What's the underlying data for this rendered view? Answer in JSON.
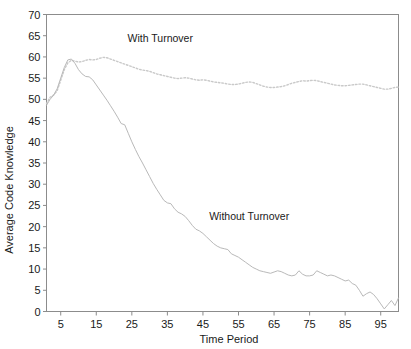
{
  "chart_data": {
    "type": "line",
    "title": "",
    "xlabel": "Time Period",
    "ylabel": "Average Code Knowledge",
    "xlim": [
      1,
      100
    ],
    "ylim": [
      0,
      70
    ],
    "grid": false,
    "legend_position": "inline-annotations",
    "xticks": [
      5,
      15,
      25,
      35,
      45,
      55,
      65,
      75,
      85,
      95
    ],
    "yticks": [
      0,
      5,
      10,
      15,
      20,
      25,
      30,
      35,
      40,
      45,
      50,
      55,
      60,
      65,
      70
    ],
    "annotations": [
      {
        "text": "With Turnover",
        "x": 33,
        "y": 63.5
      },
      {
        "text": "Without Turnover",
        "x": 58,
        "y": 21.5
      }
    ],
    "x": [
      1,
      2,
      3,
      4,
      5,
      6,
      7,
      8,
      9,
      10,
      11,
      12,
      13,
      14,
      15,
      16,
      17,
      18,
      19,
      20,
      21,
      22,
      23,
      24,
      25,
      26,
      27,
      28,
      29,
      30,
      31,
      32,
      33,
      34,
      35,
      36,
      37,
      38,
      39,
      40,
      41,
      42,
      43,
      44,
      45,
      46,
      47,
      48,
      49,
      50,
      51,
      52,
      53,
      54,
      55,
      56,
      57,
      58,
      59,
      60,
      61,
      62,
      63,
      64,
      65,
      66,
      67,
      68,
      69,
      70,
      71,
      72,
      73,
      74,
      75,
      76,
      77,
      78,
      79,
      80,
      81,
      82,
      83,
      84,
      85,
      86,
      87,
      88,
      89,
      90,
      91,
      92,
      93,
      94,
      95,
      96,
      97,
      98,
      99,
      100
    ],
    "series": [
      {
        "name": "With Turnover",
        "style": "dotted",
        "color": "#c9c9c9",
        "values": [
          49.0,
          50.5,
          51.0,
          52.0,
          54.5,
          57.0,
          58.6,
          59.2,
          59.0,
          58.8,
          58.9,
          59.2,
          59.4,
          59.3,
          59.4,
          59.7,
          59.9,
          59.8,
          59.5,
          59.2,
          58.9,
          58.6,
          58.3,
          58.0,
          57.7,
          57.4,
          57.1,
          56.9,
          56.8,
          56.6,
          56.3,
          56.0,
          55.8,
          55.6,
          55.4,
          55.2,
          55.0,
          54.9,
          55.0,
          55.1,
          55.0,
          54.8,
          54.6,
          54.5,
          54.6,
          54.5,
          54.3,
          54.1,
          54.0,
          53.9,
          53.8,
          53.6,
          53.5,
          53.5,
          53.6,
          53.8,
          54.0,
          54.1,
          54.0,
          53.7,
          53.4,
          53.1,
          52.9,
          52.8,
          52.8,
          52.9,
          53.0,
          53.2,
          53.5,
          53.8,
          54.0,
          54.2,
          54.4,
          54.3,
          54.4,
          54.5,
          54.4,
          54.2,
          54.0,
          53.8,
          53.6,
          53.4,
          53.3,
          53.2,
          53.2,
          53.3,
          53.4,
          53.5,
          53.6,
          53.6,
          53.4,
          53.2,
          53.0,
          52.8,
          52.6,
          52.4,
          52.4,
          52.6,
          52.8,
          52.9
        ]
      },
      {
        "name": "Without Turnover",
        "style": "solid",
        "color": "#b9b9b9",
        "values": [
          48.6,
          50.0,
          51.0,
          52.5,
          55.0,
          57.5,
          59.3,
          59.5,
          58.5,
          57.0,
          56.0,
          55.4,
          55.3,
          54.6,
          53.4,
          52.2,
          51.0,
          49.8,
          48.5,
          47.2,
          45.8,
          44.3,
          44.0,
          42.0,
          40.0,
          38.2,
          36.5,
          35.0,
          33.4,
          31.8,
          30.2,
          28.8,
          27.5,
          26.2,
          25.6,
          25.4,
          24.2,
          23.4,
          23.0,
          22.4,
          21.4,
          20.3,
          19.4,
          19.0,
          18.4,
          17.6,
          16.8,
          16.0,
          15.4,
          15.0,
          14.8,
          14.6,
          13.6,
          13.2,
          12.8,
          12.2,
          11.6,
          11.0,
          10.4,
          10.0,
          9.6,
          9.4,
          9.2,
          9.0,
          9.3,
          9.6,
          9.4,
          9.0,
          8.6,
          8.4,
          8.6,
          9.6,
          8.8,
          8.4,
          8.4,
          8.6,
          9.6,
          9.2,
          8.8,
          8.4,
          8.6,
          8.4,
          8.0,
          7.6,
          7.2,
          7.4,
          6.6,
          6.2,
          5.0,
          3.6,
          4.2,
          4.6,
          4.0,
          3.0,
          1.8,
          0.6,
          1.6,
          2.6,
          1.4,
          3.2
        ]
      }
    ]
  }
}
